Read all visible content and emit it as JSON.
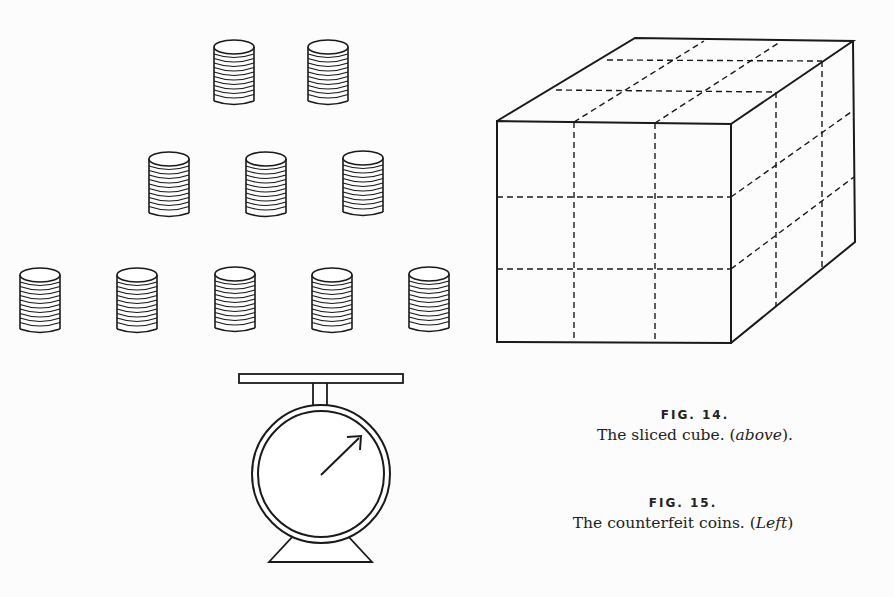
{
  "figures": {
    "fig14": {
      "label": "FIG. 14.",
      "caption_main": "The sliced cube. (",
      "caption_italic": "above",
      "caption_end": ").",
      "subject": "sliced-cube"
    },
    "fig15": {
      "label": "FIG. 15.",
      "caption_main": "The counterfeit coins. (",
      "caption_italic": "Left",
      "caption_end": ")",
      "subject": "counterfeit-coins"
    }
  },
  "coin_stacks": {
    "rows": [
      2,
      3,
      5
    ],
    "total": 10
  },
  "colors": {
    "background": "#fcfcfc",
    "ink": "#1a1a1a"
  }
}
